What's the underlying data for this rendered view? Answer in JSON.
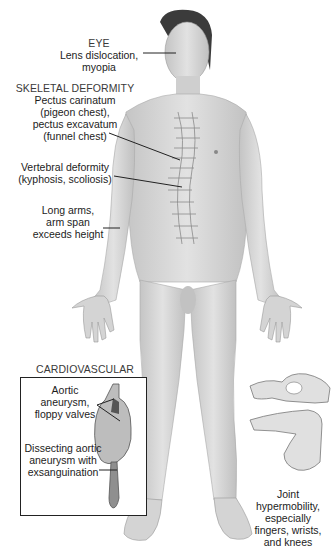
{
  "labels": {
    "eye": {
      "heading": "EYE",
      "lines": [
        "Lens dislocation,",
        "myopia"
      ]
    },
    "skeletal": {
      "heading": "SKELETAL DEFORMITY",
      "chest": [
        "Pectus carinatum",
        "(pigeon chest),",
        "pectus excavatum",
        "(funnel chest)"
      ],
      "vertebral": [
        "Vertebral deformity",
        "(kyphosis, scoliosis)"
      ],
      "arms": [
        "Long arms,",
        "arm span",
        "exceeds height"
      ]
    },
    "cardiovascular": {
      "heading": "CARDIOVASCULAR",
      "aortic": [
        "Aortic",
        "aneurysm,",
        "floppy valves"
      ],
      "dissecting": [
        "Dissecting aortic",
        "aneurysm with",
        "exsanguination"
      ]
    },
    "joint": {
      "lines": [
        "Joint",
        "hypermobility,",
        "especially",
        "fingers, wrists,",
        "and knees"
      ]
    }
  },
  "colors": {
    "skin": "#d9d9d9",
    "skin_shadow": "#b5b5b5",
    "hair": "#3a3a3a",
    "line": "#222222",
    "text": "#1c1c1c"
  }
}
